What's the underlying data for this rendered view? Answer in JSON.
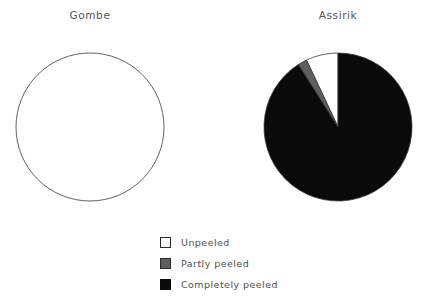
{
  "figure": {
    "background_color": "#ffffff",
    "width": 422,
    "height": 300
  },
  "panels": [
    {
      "id": "gombe",
      "title": "Gombe"
    },
    {
      "id": "assirik",
      "title": "Assirik"
    }
  ],
  "legend": {
    "items": [
      {
        "label": "Unpeeled",
        "color": "#ffffff",
        "edge_color": "#2b2b2b"
      },
      {
        "label": "Partly peeled",
        "color": "#5e5e5e",
        "edge_color": "#2b2b2b"
      },
      {
        "label": "Completely peeled",
        "color": "#0a0a0a",
        "edge_color": "#0a0a0a"
      }
    ]
  },
  "chart_data": {
    "type": "pie",
    "title": "",
    "legend_position": "bottom-center",
    "categories": [
      "Unpeeled",
      "Partly peeled",
      "Completely peeled"
    ],
    "colors": [
      "#ffffff",
      "#5e5e5e",
      "#0a0a0a"
    ],
    "edge_color": "#3a3a3a",
    "start_angle": 90,
    "direction": "counterclockwise",
    "charts": [
      {
        "name": "Gombe",
        "values": [
          100,
          0,
          0
        ],
        "units": "percent"
      },
      {
        "name": "Assirik",
        "values": [
          7,
          2,
          91
        ],
        "units": "percent"
      }
    ]
  }
}
